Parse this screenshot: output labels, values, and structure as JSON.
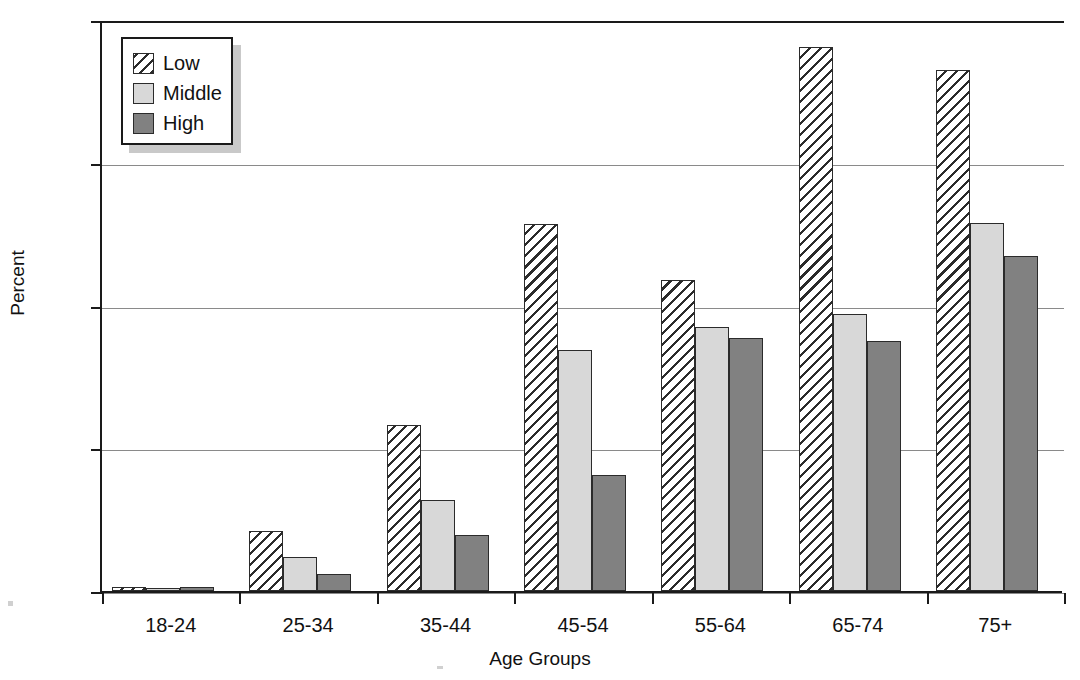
{
  "chart_data": {
    "type": "bar",
    "title": "",
    "xlabel": "Age Groups",
    "ylabel": "Percent",
    "categories": [
      "18-24",
      "25-34",
      "35-44",
      "45-54",
      "55-64",
      "65-74",
      "75+"
    ],
    "series": [
      {
        "name": "Low",
        "values": [
          0.25,
          4.2,
          11.6,
          25.7,
          21.8,
          38.1,
          36.5
        ]
      },
      {
        "name": "Middle",
        "values": [
          0.2,
          2.4,
          6.4,
          16.9,
          18.5,
          19.4,
          25.8
        ]
      },
      {
        "name": "High",
        "values": [
          0.25,
          1.2,
          3.9,
          8.1,
          17.7,
          17.5,
          23.5
        ]
      }
    ],
    "ylim": [
      0,
      40
    ],
    "yticks": [
      0,
      10,
      20,
      30,
      40
    ],
    "ytick_labels": [
      "0",
      "10",
      "20",
      "30",
      "40"
    ],
    "grid": "horizontal",
    "legend_position": "top-left",
    "legend_entries": [
      "Low",
      "Middle",
      "High"
    ],
    "colors": {
      "low": "#ffffff",
      "low_hatch": "#2b2b2b",
      "middle": "#d8d8d8",
      "high": "#818181",
      "axis": "#1a1a1a",
      "gridline": "#8a8a8a",
      "background": "#ffffff"
    }
  }
}
